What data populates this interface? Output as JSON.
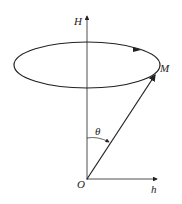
{
  "diagram": {
    "labels": {
      "H": "H",
      "M": "M",
      "theta": "θ",
      "O": "O",
      "h": "h"
    },
    "colors": {
      "stroke": "#222222",
      "background": "#ffffff"
    }
  }
}
